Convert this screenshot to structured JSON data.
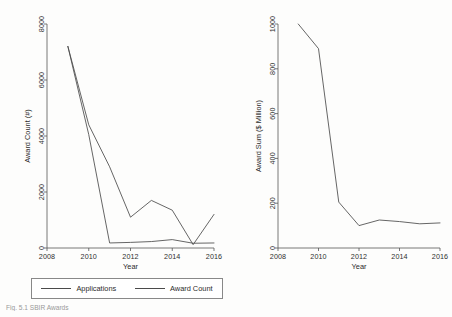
{
  "figure": {
    "caption": "Fig. 5.1  SBIR Awards"
  },
  "legend": {
    "entries": [
      {
        "label": "Applications"
      },
      {
        "label": "Award Count"
      }
    ]
  },
  "chart_data": [
    {
      "type": "line",
      "panel": "left",
      "title": "",
      "xlabel": "Year",
      "ylabel": "Award Count (#)",
      "xlim": [
        2008,
        2016
      ],
      "ylim": [
        0,
        8000
      ],
      "xticks": [
        2008,
        2010,
        2012,
        2014,
        2016
      ],
      "yticks": [
        0,
        2000,
        4000,
        6000,
        8000
      ],
      "grid": false,
      "legend_position": "below",
      "x": [
        2009,
        2010,
        2011,
        2012,
        2013,
        2014,
        2015,
        2016
      ],
      "series": [
        {
          "name": "Applications",
          "values": [
            7200,
            4050,
            180,
            200,
            230,
            300,
            170,
            180
          ]
        },
        {
          "name": "Award Count",
          "values": [
            7200,
            4400,
            2900,
            1100,
            1700,
            1350,
            120,
            1200
          ]
        }
      ]
    },
    {
      "type": "line",
      "panel": "right",
      "title": "",
      "xlabel": "Year",
      "ylabel": "Award Sum ($ Million)",
      "xlim": [
        2008,
        2016
      ],
      "ylim": [
        0,
        1000
      ],
      "xticks": [
        2008,
        2010,
        2012,
        2014,
        2016
      ],
      "yticks": [
        0,
        200,
        400,
        600,
        800,
        1000
      ],
      "grid": false,
      "legend_position": "none",
      "x": [
        2009,
        2010,
        2011,
        2012,
        2013,
        2014,
        2015,
        2016
      ],
      "series": [
        {
          "name": "Award Sum",
          "values": [
            1000,
            890,
            205,
            100,
            125,
            118,
            108,
            112
          ]
        }
      ]
    }
  ]
}
